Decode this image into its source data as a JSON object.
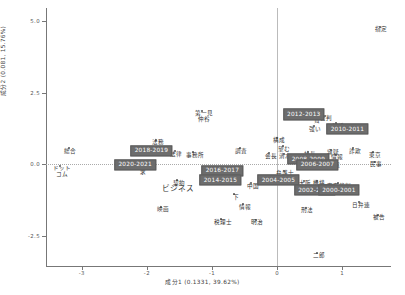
{
  "chart_data": {
    "type": "scatter",
    "title": "",
    "xlabel": "成分1 (0.1331, 39.62%)",
    "ylabel": "成分2 (0.081, 15.76%)",
    "xlim": [
      -3.55,
      1.75
    ],
    "ylim": [
      -3.55,
      5.45
    ],
    "xticks": [
      "-3",
      "-2",
      "-1",
      "0",
      "1"
    ],
    "xtickvals": [
      -3,
      -2,
      -1,
      0,
      1
    ],
    "yticks": [
      "5.0",
      "2.5",
      "0.0",
      "-2.5"
    ],
    "ytickvals": [
      5.0,
      2.5,
      0.0,
      -2.5
    ],
    "grid": false,
    "legend": "none",
    "zero_lines": true,
    "year_boxes": [
      {
        "label": "2020-2021",
        "x": -2.18,
        "y": -0.02
      },
      {
        "label": "2018-2019",
        "x": -1.93,
        "y": 0.47
      },
      {
        "label": "2016-2017",
        "x": -0.84,
        "y": -0.23
      },
      {
        "label": "2014-2015",
        "x": -0.87,
        "y": -0.55
      },
      {
        "label": "2012-2013",
        "x": 0.41,
        "y": 1.74
      },
      {
        "label": "2010-2011",
        "x": 1.08,
        "y": 1.22
      },
      {
        "label": "2008-2009",
        "x": 0.48,
        "y": 0.18
      },
      {
        "label": "2006-2007",
        "x": 0.62,
        "y": -0.02
      },
      {
        "label": "2004-2005",
        "x": 0.02,
        "y": -0.55
      },
      {
        "label": "2002-2003",
        "x": 0.58,
        "y": -0.9
      },
      {
        "label": "2000-2001",
        "x": 0.95,
        "y": -0.9
      }
    ],
    "points": [
      {
        "label": "指定",
        "x": 1.58,
        "y": 4.79,
        "size": "normal"
      },
      {
        "label": "第一見\n仲谷",
        "x": -1.15,
        "y": 1.87,
        "size": "normal"
      },
      {
        "label": "法務",
        "x": -1.86,
        "y": 0.85,
        "size": "normal"
      },
      {
        "label": "法律",
        "x": -1.57,
        "y": 0.46,
        "size": "normal"
      },
      {
        "label": "事務所",
        "x": -1.29,
        "y": 0.42,
        "size": "normal"
      },
      {
        "label": "総合",
        "x": -3.2,
        "y": 0.55,
        "size": "normal"
      },
      {
        "label": "ドット\nコム",
        "x": -3.33,
        "y": -0.05,
        "size": "normal"
      },
      {
        "label": "求",
        "x": -2.08,
        "y": -0.17,
        "size": "normal"
      },
      {
        "label": "調査",
        "x": -0.57,
        "y": 0.56,
        "size": "normal"
      },
      {
        "label": "構成",
        "x": 0.0,
        "y": 0.92,
        "size": "normal"
      },
      {
        "label": "望む",
        "x": 0.09,
        "y": 0.62,
        "size": "normal"
      },
      {
        "label": "会長",
        "x": -0.12,
        "y": 0.38,
        "size": "normal"
      },
      {
        "label": "清水",
        "x": 0.1,
        "y": 0.37,
        "size": "normal"
      },
      {
        "label": "強い",
        "x": 0.56,
        "y": 1.33,
        "size": "normal"
      },
      {
        "label": "公判",
        "x": 0.73,
        "y": 1.7,
        "size": "normal"
      },
      {
        "label": "貧",
        "x": 0.59,
        "y": 1.62,
        "size": "normal"
      },
      {
        "label": "起訴",
        "x": 0.91,
        "y": 1.43,
        "size": "normal"
      },
      {
        "label": "福岡",
        "x": 1.0,
        "y": 1.29,
        "size": "normal"
      },
      {
        "label": "社長",
        "x": 0.48,
        "y": 0.43,
        "size": "normal"
      },
      {
        "label": "容疑",
        "x": 0.83,
        "y": 0.5,
        "size": "normal"
      },
      {
        "label": "詐欺",
        "x": 1.17,
        "y": 0.55,
        "size": "normal"
      },
      {
        "label": "東京",
        "x": 1.48,
        "y": 0.42,
        "size": "normal"
      },
      {
        "label": "情報",
        "x": 0.9,
        "y": 0.33,
        "size": "normal"
      },
      {
        "label": "地裁",
        "x": 0.85,
        "y": 0.05,
        "size": "normal"
      },
      {
        "label": "民事",
        "x": 1.5,
        "y": 0.08,
        "size": "normal"
      },
      {
        "label": "弁護士",
        "x": 0.1,
        "y": -0.23,
        "size": "normal"
      },
      {
        "label": "企業",
        "x": -0.87,
        "y": -0.37,
        "size": "big"
      },
      {
        "label": "契約",
        "x": -1.53,
        "y": -0.55,
        "size": "normal"
      },
      {
        "label": "ビジネス",
        "x": -1.55,
        "y": -0.72,
        "size": "big"
      },
      {
        "label": "中国",
        "x": -0.4,
        "y": -0.66,
        "size": "normal"
      },
      {
        "label": "下",
        "x": -0.66,
        "y": -1.05,
        "size": "normal"
      },
      {
        "label": "情報",
        "x": -0.52,
        "y": -1.39,
        "size": "normal"
      },
      {
        "label": "映画",
        "x": -1.78,
        "y": -1.48,
        "size": "normal"
      },
      {
        "label": "税理士",
        "x": -0.86,
        "y": -1.92,
        "size": "normal"
      },
      {
        "label": "明治",
        "x": -0.33,
        "y": -1.93,
        "size": "normal"
      },
      {
        "label": "大阪",
        "x": 0.41,
        "y": -0.58,
        "size": "normal"
      },
      {
        "label": "機構",
        "x": 0.62,
        "y": -0.58,
        "size": "normal"
      },
      {
        "label": "東京裁判",
        "x": 0.93,
        "y": -0.66,
        "size": "normal"
      },
      {
        "label": "国家公務",
        "x": 0.6,
        "y": -0.76,
        "size": "normal"
      },
      {
        "label": "事件",
        "x": 0.79,
        "y": -0.74,
        "size": "normal"
      },
      {
        "label": "日弁連",
        "x": 1.26,
        "y": -1.32,
        "size": "normal"
      },
      {
        "label": "刑法",
        "x": 0.44,
        "y": -1.52,
        "size": "normal"
      },
      {
        "label": "被告",
        "x": 1.55,
        "y": -1.76,
        "size": "normal"
      },
      {
        "label": "二郎",
        "x": 0.62,
        "y": -3.08,
        "size": "normal"
      }
    ]
  }
}
